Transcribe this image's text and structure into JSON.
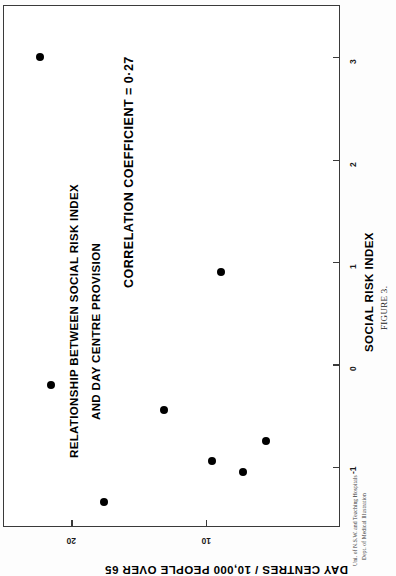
{
  "figure": {
    "title_lines": [
      "RELATIONSHIP BETWEEN SOCIAL RISK INDEX",
      "AND DAY CENTRE PROVISION"
    ],
    "correlation_note": "CORRELATION  COEFFICIENT = 0·27",
    "caption": "FIGURE 3.",
    "credit_lines": [
      "Uni. of N.S.W. and Teaching Hospitals",
      "Dept. of Medical Illustration"
    ]
  },
  "chart_data": {
    "type": "scatter",
    "title": "RELATIONSHIP BETWEEN SOCIAL RISK INDEX AND DAY CENTRE PROVISION",
    "subtitle": "CORRELATION  COEFFICIENT = 0·27",
    "xlabel": "SOCIAL RISK INDEX",
    "ylabel": "DAY CENTRES / 10,000 PEOPLE OVER 65",
    "xlim": [
      -1.6,
      3.5
    ],
    "ylim": [
      0,
      25
    ],
    "xticks": [
      -1,
      0,
      1,
      2,
      3
    ],
    "xtick_labels": [
      "-1",
      "0",
      "1",
      "2",
      "3"
    ],
    "yticks": [
      10,
      20
    ],
    "ytick_labels": [
      "10",
      "20"
    ],
    "grid": false,
    "legend": null,
    "correlation_coefficient": 0.27,
    "n_points": 8,
    "points": [
      {
        "x": 3.0,
        "y": 22.3
      },
      {
        "x": 0.9,
        "y": 8.9
      },
      {
        "x": -0.2,
        "y": 21.5
      },
      {
        "x": -0.45,
        "y": 13.1
      },
      {
        "x": -0.75,
        "y": 5.6
      },
      {
        "x": -0.95,
        "y": 9.6
      },
      {
        "x": -1.05,
        "y": 7.3
      },
      {
        "x": -1.35,
        "y": 17.6
      }
    ],
    "marker": {
      "shape": "circle",
      "color": "#000000",
      "size": 8
    },
    "frame_color": "#3a3a3a",
    "background": "#ffffff",
    "rotation_deg": 90
  }
}
